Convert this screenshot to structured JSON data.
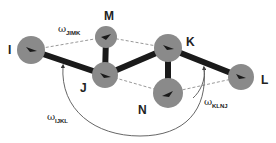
{
  "diagram": {
    "type": "molecular-torsion-diagram",
    "atoms": [
      {
        "id": "I",
        "label": "I",
        "cx": 31,
        "cy": 50,
        "r": 14,
        "lx": 8,
        "ly": 54
      },
      {
        "id": "M",
        "label": "M",
        "cx": 106,
        "cy": 37,
        "r": 11,
        "lx": 104,
        "ly": 20
      },
      {
        "id": "J",
        "label": "J",
        "cx": 105,
        "cy": 75,
        "r": 13,
        "lx": 80,
        "ly": 92
      },
      {
        "id": "K",
        "label": "K",
        "cx": 168,
        "cy": 48,
        "r": 14,
        "lx": 186,
        "ly": 46
      },
      {
        "id": "N",
        "label": "N",
        "cx": 168,
        "cy": 93,
        "r": 15,
        "lx": 138,
        "ly": 114
      },
      {
        "id": "L",
        "label": "L",
        "cx": 241,
        "cy": 77,
        "r": 13,
        "lx": 261,
        "ly": 84
      }
    ],
    "bonds": [
      [
        "I",
        "J"
      ],
      [
        "J",
        "M"
      ],
      [
        "J",
        "K"
      ],
      [
        "K",
        "N"
      ],
      [
        "K",
        "L"
      ]
    ],
    "dashed_lines": [
      [
        "I",
        "M"
      ],
      [
        "M",
        "K"
      ],
      [
        "I",
        "K"
      ],
      [
        "J",
        "N"
      ],
      [
        "N",
        "L"
      ],
      [
        "K",
        "L"
      ]
    ],
    "angles": [
      {
        "symbol": "ω",
        "subscript": "JIMK",
        "x": 60,
        "y": 32
      },
      {
        "symbol": "ω",
        "subscript": "IJKL",
        "x": 49,
        "y": 121
      },
      {
        "symbol": "ω",
        "subscript": "KLNJ",
        "x": 205,
        "y": 106
      }
    ],
    "colors": {
      "atom": "#8a8a8a",
      "bond": "#1a1a1a",
      "dashed": "#8c8c8c",
      "arc": "#555555",
      "background": "#ffffff"
    }
  },
  "labels": {
    "I": "I",
    "M": "M",
    "J": "J",
    "K": "K",
    "N": "N",
    "L": "L",
    "omega": "ω",
    "sub_jimk": "JIMK",
    "sub_ijkl": "IJKL",
    "sub_klnj": "KLNJ"
  }
}
